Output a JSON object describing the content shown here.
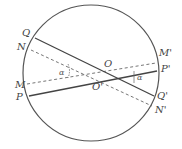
{
  "diagram": {
    "circle": {
      "cx": 91,
      "cy": 73,
      "r": 68,
      "stroke": "#555555"
    },
    "solid_lines": [
      {
        "id": "QQ'",
        "from": [
          35,
          38
        ],
        "to": [
          154,
          96
        ],
        "start_label": "Q",
        "end_label": "Q'"
      },
      {
        "id": "PP'",
        "from": [
          29,
          96
        ],
        "to": [
          157,
          71
        ],
        "start_label": "P",
        "end_label": "P'"
      }
    ],
    "dashed_lines": [
      {
        "id": "NN'",
        "from": [
          31,
          50
        ],
        "to": [
          152,
          106
        ],
        "start_label": "N",
        "end_label": "N'"
      },
      {
        "id": "MM'",
        "from": [
          27,
          84
        ],
        "to": [
          156,
          63
        ],
        "start_label": "M",
        "end_label": "M'"
      }
    ],
    "points": {
      "O": {
        "label": "O",
        "x": 104,
        "y": 66
      },
      "O_prime": {
        "label": "O'",
        "x": 92,
        "y": 89
      }
    },
    "labels": {
      "Q": "Q",
      "N": "N",
      "M": "M",
      "P": "P",
      "M_prime": "M'",
      "P_prime": "P'",
      "Q_prime": "Q'",
      "N_prime": "N'",
      "alpha_left": "α",
      "alpha_right": "α"
    },
    "colors": {
      "line": "#444444",
      "dashed": "#666666",
      "text": "#444444"
    }
  }
}
